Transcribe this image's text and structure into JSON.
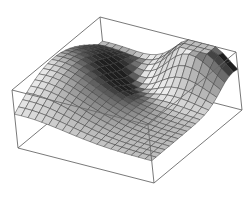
{
  "chart_data": {
    "type": "surface3d",
    "title": "",
    "xlabel": "",
    "ylabel": "",
    "zlabel": "",
    "axes_ticks": "none",
    "boxed": true,
    "grid_lines": 20,
    "box_projection": {
      "top_left": [
        12,
        90
      ],
      "top_back": [
        100,
        17
      ],
      "top_right": [
        236,
        52
      ],
      "top_front": [
        148,
        125
      ],
      "bottom_left": [
        18,
        148
      ],
      "bottom_front": [
        165,
        200
      ],
      "bottom_right": [
        238,
        110
      ]
    },
    "colors": {
      "box": "#6a6a6a",
      "surface_light": "#e8e8e8",
      "surface_dark": "#1e1e1e",
      "background": "#ffffff"
    }
  }
}
